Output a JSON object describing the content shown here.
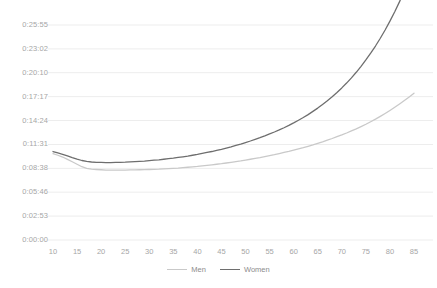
{
  "chart_data": {
    "type": "line",
    "title": "",
    "subtitle": "",
    "xlabel": "",
    "ylabel": "",
    "grid": true,
    "legend_position": "bottom",
    "x": [
      10,
      11,
      12,
      13,
      14,
      15,
      16,
      17,
      18,
      19,
      20,
      21,
      22,
      23,
      24,
      25,
      26,
      27,
      28,
      29,
      30,
      31,
      32,
      33,
      34,
      35,
      36,
      37,
      38,
      39,
      40,
      41,
      42,
      43,
      44,
      45,
      46,
      47,
      48,
      49,
      50,
      51,
      52,
      53,
      54,
      55,
      56,
      57,
      58,
      59,
      60,
      61,
      62,
      63,
      64,
      65,
      66,
      67,
      68,
      69,
      70,
      71,
      72,
      73,
      74,
      75,
      76,
      77,
      78,
      79,
      80,
      81,
      82,
      83,
      84,
      85
    ],
    "x_ticks": [
      "10",
      "15",
      "20",
      "25",
      "30",
      "35",
      "40",
      "45",
      "50",
      "55",
      "60",
      "65",
      "70",
      "75",
      "80",
      "85"
    ],
    "y_ticks": [
      "0:00:00",
      "0:02:53",
      "0:05:46",
      "0:08:38",
      "0:11:31",
      "0:14:24",
      "0:17:17",
      "0:20:10",
      "0:23:02",
      "0:25:55"
    ],
    "y_tick_seconds": [
      0,
      173,
      346,
      518,
      691,
      864,
      1037,
      1210,
      1382,
      1555
    ],
    "ylim_seconds": [
      0,
      1555
    ],
    "xlim": [
      10,
      85
    ],
    "series": [
      {
        "name": "Men",
        "color": "#c9c9c9",
        "values_seconds": [
          625,
          613,
          600,
          583,
          566,
          548,
          530,
          518,
          512,
          510,
          508,
          506,
          505,
          505,
          506,
          506,
          507,
          507,
          508,
          509,
          510,
          511,
          512,
          514,
          516,
          518,
          520,
          523,
          526,
          529,
          532,
          536,
          540,
          544,
          548,
          552,
          557,
          562,
          567,
          572,
          578,
          584,
          590,
          596,
          603,
          610,
          617,
          625,
          633,
          641,
          650,
          659,
          668,
          678,
          688,
          699,
          710,
          722,
          734,
          747,
          760,
          774,
          789,
          804,
          820,
          837,
          855,
          874,
          894,
          915,
          937,
          960,
          984,
          1009,
          1035,
          1062
        ]
      },
      {
        "name": "Women",
        "color": "#6e6e6e",
        "values_seconds": [
          640,
          630,
          620,
          608,
          596,
          585,
          575,
          568,
          564,
          562,
          561,
          560,
          560,
          561,
          562,
          563,
          565,
          567,
          569,
          571,
          574,
          577,
          580,
          584,
          588,
          592,
          597,
          602,
          607,
          613,
          619,
          626,
          633,
          640,
          648,
          656,
          665,
          674,
          684,
          694,
          705,
          716,
          728,
          740,
          753,
          767,
          781,
          796,
          812,
          829,
          847,
          866,
          886,
          907,
          930,
          954,
          980,
          1007,
          1036,
          1067,
          1100,
          1135,
          1173,
          1213,
          1256,
          1302,
          1351,
          1403,
          1459,
          1519,
          1583,
          1651,
          1724,
          1802,
          1885,
          1824
        ]
      }
    ]
  },
  "legend": {
    "items": [
      {
        "label": "Men",
        "color": "#c9c9c9"
      },
      {
        "label": "Women",
        "color": "#6e6e6e"
      }
    ]
  }
}
